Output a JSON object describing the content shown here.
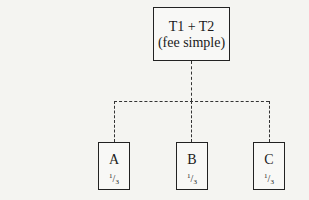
{
  "diagram": {
    "root": {
      "line1": "T1 + T2",
      "line2": "(fee simple)"
    },
    "children": [
      {
        "label": "A",
        "num": "1",
        "den": "3"
      },
      {
        "label": "B",
        "num": "1",
        "den": "3"
      },
      {
        "label": "C",
        "num": "1",
        "den": "3"
      }
    ]
  }
}
